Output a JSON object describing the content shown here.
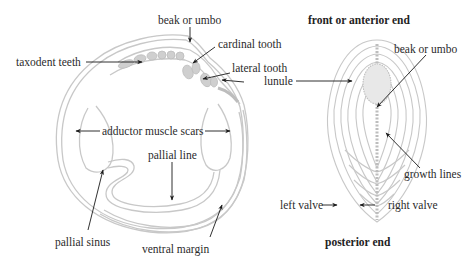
{
  "diagram": {
    "colors": {
      "shell_line": "#c8c8c8",
      "teeth_fill": "#cfcfcf",
      "arrow": "#1a1a1a",
      "text": "#2b2b2b"
    },
    "inner_view": {
      "labels": {
        "beak_or_umbo": "beak or umbo",
        "cardinal_tooth": "cardinal tooth",
        "taxodent_teeth": "taxodent teeth",
        "lateral_tooth": "lateral tooth",
        "lunule": "lunule",
        "adductor_muscle_scars": "adductor muscle scars",
        "pallial_line": "pallial line",
        "pallial_sinus": "pallial sinus",
        "ventral_margin": "ventral margin"
      }
    },
    "dorsal_view": {
      "labels": {
        "front_end": "front or anterior end",
        "beak_or_umbo": "beak or umbo",
        "growth_lines": "growth lines",
        "left_valve": "left valve",
        "right_valve": "right valve",
        "posterior_end": "posterior end"
      }
    }
  }
}
